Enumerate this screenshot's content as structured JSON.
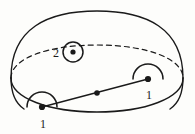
{
  "figure": {
    "background_color": "#fdfdfb",
    "stroke_color": "#1a1a1a",
    "labels": {
      "handle_left": "1",
      "handle_right": "1",
      "disk": "2"
    },
    "geometry": {
      "dome": {
        "apex_x": 97,
        "apex_y": 11,
        "left_x": 11,
        "right_x": 183,
        "rim_y": 78
      },
      "rim_ellipse": {
        "center_x": 97,
        "center_y": 78,
        "rx": 86,
        "ry": 34,
        "back_arc_style": "dashed",
        "front_arc_style": "solid"
      },
      "handle_left": {
        "dot_x": 42,
        "dot_y": 107,
        "arc_radius": 15,
        "label_x": 43,
        "label_y": 128
      },
      "handle_right": {
        "dot_x": 148,
        "dot_y": 79,
        "arc_radius": 15,
        "label_x": 149,
        "label_y": 99
      },
      "disk": {
        "center_x": 73,
        "center_y": 52,
        "outer_radius": 10,
        "dot_radius": 2.6,
        "label_x": 56,
        "label_y": 57
      },
      "segment": {
        "x1": 42,
        "y1": 107,
        "x2": 148,
        "y2": 79,
        "mid_dot_x": 97,
        "mid_dot_y": 93,
        "mid_dot_radius": 2.8
      }
    }
  }
}
